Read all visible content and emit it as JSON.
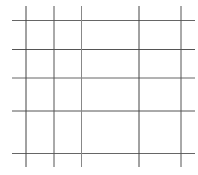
{
  "canvas": {
    "width": 198,
    "height": 175,
    "background": "#ffffff"
  },
  "grid": {
    "line_color": "#555555",
    "line_width": 1,
    "vertical_lines": [
      {
        "x": 26,
        "y1": 6,
        "y2": 167,
        "color": "#444444"
      },
      {
        "x": 54,
        "y1": 6,
        "y2": 167,
        "color": "#555555"
      },
      {
        "x": 81.5,
        "y1": 6,
        "y2": 167,
        "color": "#888888"
      },
      {
        "x": 139,
        "y1": 6,
        "y2": 167,
        "color": "#444444"
      },
      {
        "x": 181,
        "y1": 6,
        "y2": 167,
        "color": "#555555"
      }
    ],
    "horizontal_lines": [
      {
        "y": 20.5,
        "x1": 12,
        "x2": 195,
        "color": "#666666"
      },
      {
        "y": 49.5,
        "x1": 12,
        "x2": 195,
        "color": "#555555"
      },
      {
        "y": 78,
        "x1": 12,
        "x2": 195,
        "color": "#666666"
      },
      {
        "y": 111,
        "x1": 12,
        "x2": 195,
        "color": "#555555"
      },
      {
        "y": 153.5,
        "x1": 12,
        "x2": 195,
        "color": "#666666"
      }
    ]
  }
}
